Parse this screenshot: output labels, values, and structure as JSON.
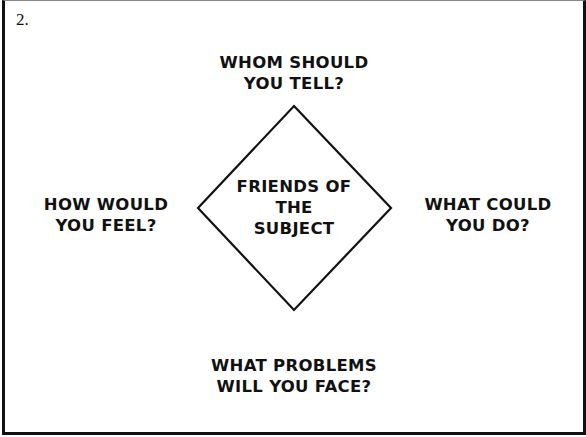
{
  "slide_number": "2.",
  "center": {
    "lines": [
      "FRIENDS OF",
      "THE",
      "SUBJECT"
    ]
  },
  "top": {
    "lines": [
      "WHOM SHOULD",
      "YOU TELL?"
    ]
  },
  "left": {
    "lines": [
      "HOW WOULD",
      "YOU FEEL?"
    ]
  },
  "right": {
    "lines": [
      "WHAT COULD",
      "YOU DO?"
    ]
  },
  "bottom": {
    "lines": [
      "WHAT PROBLEMS",
      "WILL YOU FACE?"
    ]
  },
  "colors": {
    "stroke": "#111111",
    "background": "#ffffff"
  }
}
